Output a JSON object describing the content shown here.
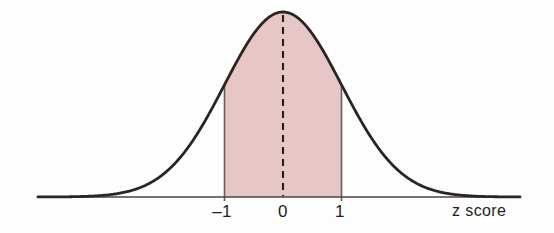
{
  "figure": {
    "kind": "normal-distribution-curve",
    "background_color": "#fdfdfd",
    "curve_color": "#2b2521",
    "shade_color": "#e6c6c6",
    "shade_edge_color": "#6b5a56",
    "axis_color": "#4a4340",
    "dash_color": "#241f1c",
    "text_color": "#231e1b"
  },
  "axis": {
    "title": "z score",
    "title_x": 452,
    "title_y": 203,
    "baseline_y": 197,
    "x_start": 38,
    "x_end": 520,
    "tick_labels": [
      {
        "text": "–1",
        "value": -1,
        "x": 222,
        "y": 203
      },
      {
        "text": "0",
        "value": 0,
        "x": 283,
        "y": 203
      },
      {
        "text": "1",
        "value": 1,
        "x": 340,
        "y": 203
      }
    ]
  },
  "chart_data": {
    "type": "area",
    "title": "",
    "subtitle": "",
    "xlabel": "z score",
    "ylabel": "",
    "grid": false,
    "legend": "none",
    "distribution": "standard normal",
    "mean": 0,
    "std_dev": 1,
    "xlim": [
      -4.2,
      4.2
    ],
    "ylim": [
      0,
      0.42
    ],
    "tick_values": [
      -1,
      0,
      1
    ],
    "tick_labels": [
      "–1",
      "0",
      "1"
    ],
    "shaded_interval": [
      -1,
      1
    ],
    "shaded_area_fraction": 0.6827,
    "center_line": {
      "x": 0,
      "style": "dashed",
      "from_y": 0,
      "to_y": 0.3989
    },
    "x": [
      -4.2,
      -3.8,
      -3.4,
      -3.0,
      -2.6,
      -2.2,
      -1.8,
      -1.4,
      -1.0,
      -0.6,
      -0.2,
      0.0,
      0.2,
      0.6,
      1.0,
      1.4,
      1.8,
      2.2,
      2.6,
      3.0,
      3.4,
      3.8,
      4.2
    ],
    "y": [
      0.0001,
      0.0003,
      0.0012,
      0.0044,
      0.0136,
      0.0355,
      0.079,
      0.1497,
      0.242,
      0.3332,
      0.391,
      0.3989,
      0.391,
      0.3332,
      0.242,
      0.1497,
      0.079,
      0.0355,
      0.0136,
      0.0044,
      0.0012,
      0.0003,
      0.0001
    ],
    "annotations": [
      {
        "text": "–1",
        "x": -1
      },
      {
        "text": "0",
        "x": 0
      },
      {
        "text": "1",
        "x": 1
      },
      {
        "text": "z score",
        "x": 3.3
      }
    ]
  }
}
